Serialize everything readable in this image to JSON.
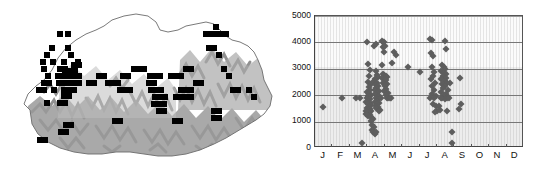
{
  "figure": {
    "panels": [
      "distribution-map",
      "elevation-month-scatter"
    ],
    "background_color": "#ffffff"
  },
  "map": {
    "name": "Bhutan distribution map",
    "country": "Bhutan",
    "terrain_color": "#8f8f8f",
    "outline_color": "#6b6b6b",
    "record_marker_color": "#000000",
    "record_marker_shape": "square",
    "record_count": 96,
    "records": [
      [
        57,
        31
      ],
      [
        65,
        31
      ],
      [
        49,
        45
      ],
      [
        65,
        45
      ],
      [
        44,
        52
      ],
      [
        68,
        52
      ],
      [
        40,
        59
      ],
      [
        50,
        59
      ],
      [
        61,
        59
      ],
      [
        41,
        66
      ],
      [
        75,
        59
      ],
      [
        57,
        66
      ],
      [
        62,
        66
      ],
      [
        71,
        62
      ],
      [
        76,
        62
      ],
      [
        45,
        73
      ],
      [
        55,
        73
      ],
      [
        60,
        73
      ],
      [
        66,
        73
      ],
      [
        71,
        73
      ],
      [
        76,
        73
      ],
      [
        62,
        68
      ],
      [
        67,
        68
      ],
      [
        72,
        68
      ],
      [
        41,
        80
      ],
      [
        46,
        80
      ],
      [
        56,
        80
      ],
      [
        61,
        80
      ],
      [
        66,
        80
      ],
      [
        71,
        80
      ],
      [
        76,
        80
      ],
      [
        36,
        87
      ],
      [
        41,
        87
      ],
      [
        51,
        87
      ],
      [
        61,
        87
      ],
      [
        66,
        87
      ],
      [
        71,
        87
      ],
      [
        61,
        93
      ],
      [
        66,
        93
      ],
      [
        57,
        100
      ],
      [
        62,
        100
      ],
      [
        44,
        100
      ],
      [
        86,
        80
      ],
      [
        91,
        80
      ],
      [
        96,
        73
      ],
      [
        101,
        73
      ],
      [
        105,
        80
      ],
      [
        110,
        80
      ],
      [
        115,
        80
      ],
      [
        120,
        73
      ],
      [
        125,
        73
      ],
      [
        117,
        87
      ],
      [
        122,
        87
      ],
      [
        127,
        87
      ],
      [
        131,
        66
      ],
      [
        136,
        66
      ],
      [
        141,
        66
      ],
      [
        147,
        73
      ],
      [
        152,
        73
      ],
      [
        157,
        73
      ],
      [
        146,
        80
      ],
      [
        151,
        80
      ],
      [
        148,
        87
      ],
      [
        153,
        87
      ],
      [
        158,
        87
      ],
      [
        152,
        94
      ],
      [
        157,
        94
      ],
      [
        162,
        94
      ],
      [
        151,
        101
      ],
      [
        156,
        101
      ],
      [
        161,
        101
      ],
      [
        156,
        108
      ],
      [
        161,
        108
      ],
      [
        168,
        73
      ],
      [
        173,
        73
      ],
      [
        178,
        73
      ],
      [
        183,
        66
      ],
      [
        188,
        66
      ],
      [
        178,
        87
      ],
      [
        183,
        87
      ],
      [
        188,
        87
      ],
      [
        173,
        94
      ],
      [
        178,
        94
      ],
      [
        183,
        94
      ],
      [
        188,
        94
      ],
      [
        193,
        80
      ],
      [
        198,
        80
      ],
      [
        203,
        31
      ],
      [
        208,
        31
      ],
      [
        213,
        31
      ],
      [
        218,
        31
      ],
      [
        223,
        31
      ],
      [
        213,
        24
      ],
      [
        206,
        45
      ],
      [
        211,
        45
      ],
      [
        216,
        52
      ],
      [
        221,
        66
      ],
      [
        226,
        73
      ],
      [
        230,
        87
      ],
      [
        235,
        87
      ],
      [
        211,
        108
      ],
      [
        216,
        108
      ],
      [
        211,
        115
      ],
      [
        216,
        115
      ],
      [
        246,
        87
      ],
      [
        251,
        94
      ],
      [
        63,
        122
      ],
      [
        68,
        122
      ],
      [
        58,
        129
      ],
      [
        63,
        129
      ],
      [
        112,
        118
      ],
      [
        117,
        118
      ],
      [
        37,
        137
      ],
      [
        42,
        137
      ],
      [
        172,
        118
      ],
      [
        177,
        118
      ]
    ]
  },
  "chart_data": {
    "type": "scatter",
    "title": "",
    "xlabel": "",
    "ylabel": "",
    "xlim": [
      0,
      12
    ],
    "ylim": [
      0,
      5000
    ],
    "ytick_labels": [
      "5000",
      "4000",
      "3000",
      "2000",
      "1000",
      "0"
    ],
    "ytick_values": [
      5000,
      4000,
      3000,
      2000,
      1000,
      0
    ],
    "xtick_labels": [
      "J",
      "F",
      "M",
      "A",
      "M",
      "J",
      "J",
      "A",
      "S",
      "O",
      "N",
      "D"
    ],
    "categories": [
      "J",
      "F",
      "M",
      "A",
      "M",
      "J",
      "J",
      "A",
      "S",
      "O",
      "N",
      "D"
    ],
    "grid": true,
    "grid_axis": "y",
    "legend": "none",
    "marker": "diamond",
    "marker_color": "#5e5e5e",
    "point_count": 163,
    "points": [
      [
        0.45,
        1540
      ],
      [
        1.55,
        1900
      ],
      [
        2.35,
        1900
      ],
      [
        2.6,
        1900
      ],
      [
        2.7,
        190
      ],
      [
        3.0,
        4000
      ],
      [
        3.05,
        3180
      ],
      [
        3.15,
        2950
      ],
      [
        3.12,
        2740
      ],
      [
        3.02,
        2500
      ],
      [
        3.2,
        2420
      ],
      [
        3.08,
        2300
      ],
      [
        3.16,
        2200
      ],
      [
        2.98,
        2130
      ],
      [
        3.1,
        2060
      ],
      [
        3.22,
        2020
      ],
      [
        3.04,
        1980
      ],
      [
        3.12,
        1930
      ],
      [
        3.0,
        1880
      ],
      [
        3.18,
        1840
      ],
      [
        3.06,
        1790
      ],
      [
        2.94,
        1740
      ],
      [
        3.14,
        1700
      ],
      [
        3.02,
        1650
      ],
      [
        3.2,
        1610
      ],
      [
        3.08,
        1560
      ],
      [
        2.96,
        1520
      ],
      [
        3.16,
        1470
      ],
      [
        3.04,
        1430
      ],
      [
        3.24,
        1390
      ],
      [
        3.12,
        1340
      ],
      [
        3.0,
        1290
      ],
      [
        3.18,
        1250
      ],
      [
        3.06,
        1200
      ],
      [
        2.9,
        1420
      ],
      [
        2.92,
        1300
      ],
      [
        3.28,
        1150
      ],
      [
        3.34,
        1090
      ],
      [
        3.22,
        1030
      ],
      [
        3.3,
        860
      ],
      [
        3.38,
        780
      ],
      [
        3.26,
        700
      ],
      [
        3.34,
        620
      ],
      [
        3.42,
        560
      ],
      [
        3.46,
        520
      ],
      [
        3.5,
        620
      ],
      [
        3.55,
        2760
      ],
      [
        3.6,
        2700
      ],
      [
        3.5,
        2900
      ],
      [
        3.45,
        2620
      ],
      [
        3.4,
        2530
      ],
      [
        3.58,
        2480
      ],
      [
        3.48,
        2380
      ],
      [
        3.62,
        2330
      ],
      [
        3.52,
        2260
      ],
      [
        3.42,
        2200
      ],
      [
        3.66,
        2150
      ],
      [
        3.56,
        2090
      ],
      [
        3.46,
        2030
      ],
      [
        3.7,
        1980
      ],
      [
        3.6,
        1920
      ],
      [
        3.5,
        1880
      ],
      [
        3.64,
        1840
      ],
      [
        3.54,
        1790
      ],
      [
        3.44,
        1740
      ],
      [
        3.68,
        1700
      ],
      [
        3.58,
        1650
      ],
      [
        3.48,
        1600
      ],
      [
        3.62,
        1550
      ],
      [
        3.52,
        1500
      ],
      [
        3.72,
        1450
      ],
      [
        3.66,
        1400
      ],
      [
        3.38,
        3880
      ],
      [
        3.5,
        3930
      ],
      [
        3.85,
        4040
      ],
      [
        3.92,
        4020
      ],
      [
        3.98,
        4000
      ],
      [
        3.88,
        3830
      ],
      [
        4.0,
        3860
      ],
      [
        3.94,
        3620
      ],
      [
        3.82,
        3150
      ],
      [
        3.9,
        2800
      ],
      [
        3.98,
        2760
      ],
      [
        4.05,
        2740
      ],
      [
        4.12,
        2700
      ],
      [
        3.86,
        2650
      ],
      [
        4.0,
        2600
      ],
      [
        4.08,
        2560
      ],
      [
        3.92,
        2480
      ],
      [
        4.15,
        2430
      ],
      [
        4.02,
        2330
      ],
      [
        4.1,
        2250
      ],
      [
        3.96,
        2160
      ],
      [
        4.18,
        2080
      ],
      [
        4.06,
        1990
      ],
      [
        4.22,
        1910
      ],
      [
        4.14,
        1880
      ],
      [
        4.28,
        1880
      ],
      [
        3.8,
        1880
      ],
      [
        4.34,
        1880
      ],
      [
        4.4,
        3220
      ],
      [
        4.52,
        3630
      ],
      [
        4.64,
        3540
      ],
      [
        5.35,
        3080
      ],
      [
        6.05,
        2880
      ],
      [
        6.62,
        4110
      ],
      [
        6.7,
        4090
      ],
      [
        6.68,
        3600
      ],
      [
        6.8,
        3470
      ],
      [
        6.72,
        3050
      ],
      [
        6.84,
        2880
      ],
      [
        6.78,
        2740
      ],
      [
        6.66,
        2600
      ],
      [
        6.9,
        2450
      ],
      [
        6.74,
        2340
      ],
      [
        6.86,
        2180
      ],
      [
        6.7,
        2050
      ],
      [
        6.94,
        1980
      ],
      [
        6.62,
        1900
      ],
      [
        6.82,
        1880
      ],
      [
        6.76,
        1680
      ],
      [
        6.92,
        1600
      ],
      [
        7.0,
        1420
      ],
      [
        6.88,
        1380
      ],
      [
        7.1,
        1600
      ],
      [
        7.18,
        1450
      ],
      [
        7.45,
        4060
      ],
      [
        7.52,
        3760
      ],
      [
        7.3,
        3130
      ],
      [
        7.38,
        3060
      ],
      [
        7.46,
        2980
      ],
      [
        7.26,
        2900
      ],
      [
        7.42,
        2840
      ],
      [
        7.54,
        2790
      ],
      [
        7.34,
        2720
      ],
      [
        7.5,
        2660
      ],
      [
        7.22,
        2600
      ],
      [
        7.44,
        2540
      ],
      [
        7.58,
        2480
      ],
      [
        7.3,
        2420
      ],
      [
        7.48,
        2360
      ],
      [
        7.36,
        2280
      ],
      [
        7.62,
        2200
      ],
      [
        7.26,
        2120
      ],
      [
        7.52,
        2040
      ],
      [
        7.4,
        1990
      ],
      [
        7.66,
        1930
      ],
      [
        7.32,
        1890
      ],
      [
        7.56,
        1880
      ],
      [
        7.44,
        1860
      ],
      [
        7.7,
        1880
      ],
      [
        7.6,
        1420
      ],
      [
        7.22,
        1880
      ],
      [
        7.74,
        2450
      ],
      [
        7.88,
        600
      ],
      [
        7.86,
        180
      ],
      [
        8.3,
        2660
      ],
      [
        8.36,
        1680
      ],
      [
        8.28,
        1490
      ]
    ]
  }
}
